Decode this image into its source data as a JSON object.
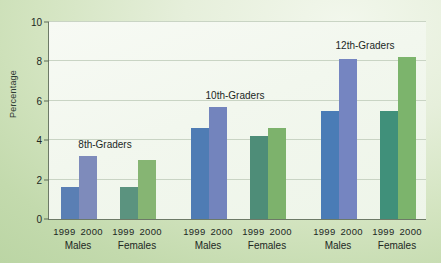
{
  "chart_data": {
    "type": "bar",
    "title": "",
    "xlabel": "",
    "ylabel": "Percentage",
    "ylim": [
      0,
      10
    ],
    "yticks": [
      0,
      2,
      4,
      6,
      8,
      10
    ],
    "grid": true,
    "legend": "none",
    "categories": [
      "8th-Graders Males",
      "8th-Graders Females",
      "10th-Graders Males",
      "10th-Graders Females",
      "12th-Graders Males",
      "12th-Graders Females"
    ],
    "series": [
      {
        "name": "1999",
        "values": [
          1.6,
          1.6,
          4.6,
          4.2,
          5.5,
          5.5
        ]
      },
      {
        "name": "2000",
        "values": [
          3.2,
          3.0,
          5.7,
          4.6,
          8.1,
          8.2
        ]
      }
    ],
    "groups": [
      {
        "title": "8th-Graders",
        "title_x": 104,
        "subgroups": [
          {
            "sex": "Males",
            "center_x": 78,
            "bars": [
              {
                "year": "1999",
                "value": 1.6,
                "color": "#5a7fb4",
                "x": 60,
                "width": 18
              },
              {
                "year": "2000",
                "value": 3.2,
                "color": "#7e8bbb",
                "x": 78,
                "width": 18
              }
            ]
          },
          {
            "sex": "Females",
            "center_x": 137,
            "bars": [
              {
                "year": "1999",
                "value": 1.6,
                "color": "#5b937f",
                "x": 119,
                "width": 18
              },
              {
                "year": "2000",
                "value": 3.0,
                "color": "#86b573",
                "x": 137,
                "width": 18
              }
            ]
          }
        ]
      },
      {
        "title": "10th-Graders",
        "title_x": 234,
        "subgroups": [
          {
            "sex": "Males",
            "center_x": 208,
            "bars": [
              {
                "year": "1999",
                "value": 4.6,
                "color": "#4f7cb4",
                "x": 190,
                "width": 18
              },
              {
                "year": "2000",
                "value": 5.7,
                "color": "#7384bd",
                "x": 208,
                "width": 18
              }
            ]
          },
          {
            "sex": "Females",
            "center_x": 267,
            "bars": [
              {
                "year": "1999",
                "value": 4.2,
                "color": "#4e8d78",
                "x": 249,
                "width": 18
              },
              {
                "year": "2000",
                "value": 4.6,
                "color": "#7db26c",
                "x": 267,
                "width": 18
              }
            ]
          }
        ]
      },
      {
        "title": "12th-Graders",
        "title_x": 364,
        "subgroups": [
          {
            "sex": "Males",
            "center_x": 338,
            "bars": [
              {
                "year": "1999",
                "value": 5.5,
                "color": "#4a7cb6",
                "x": 320,
                "width": 18
              },
              {
                "year": "2000",
                "value": 8.1,
                "color": "#7585c1",
                "x": 338,
                "width": 18
              }
            ]
          },
          {
            "sex": "Females",
            "center_x": 397,
            "bars": [
              {
                "year": "1999",
                "value": 5.5,
                "color": "#40907a",
                "x": 379,
                "width": 18
              },
              {
                "year": "2000",
                "value": 8.2,
                "color": "#7cb46c",
                "x": 397,
                "width": 18
              }
            ]
          }
        ]
      }
    ]
  },
  "axis": {
    "y_title": "Percentage",
    "y_ticks": [
      "0",
      "2",
      "4",
      "6",
      "8",
      "10"
    ],
    "x_year_first": "1999",
    "x_year_second": "2000"
  },
  "colors": {
    "male_1999": "#5a7fb4",
    "male_2000": "#7e8bbb",
    "female_1999": "#5b937f",
    "female_2000": "#86b573",
    "background_light": "#f2f7ec",
    "background_dark": "#b9d4a2",
    "plot_background": "#f4f8f0",
    "gridline": "#c9d4c4",
    "axis_line": "#6d7a67",
    "text": "#21271f"
  }
}
